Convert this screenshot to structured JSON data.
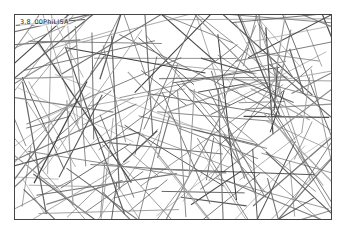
{
  "figure": {
    "label": "3.8_00PhiLISA"
  },
  "colors": {
    "line": "#555555",
    "frame": "#444444",
    "background": "#ffffff"
  }
}
